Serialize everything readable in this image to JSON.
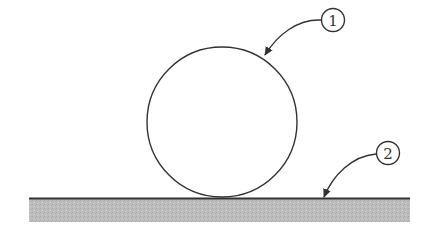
{
  "diagram": {
    "type": "labeled-figure",
    "colors": {
      "line": "#333333",
      "ground_fill": "#b8b8b8",
      "background": "#ffffff"
    },
    "callouts": [
      {
        "number": "1",
        "target": "circle"
      },
      {
        "number": "2",
        "target": "ground-surface"
      }
    ]
  }
}
